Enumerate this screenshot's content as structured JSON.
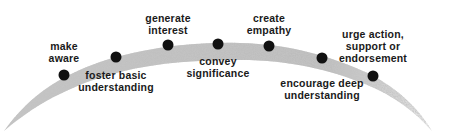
{
  "diagram": {
    "title": "",
    "arc_color": "#b8b8b8",
    "dot_color": "#111111",
    "stages": [
      {
        "label_lines": [
          "make",
          "aware"
        ],
        "dot": [
          64,
          75
        ],
        "label_pos": [
          64,
          40
        ]
      },
      {
        "label_lines": [
          "foster basic",
          "understanding"
        ],
        "dot": [
          116,
          57
        ],
        "label_pos": [
          116,
          69
        ]
      },
      {
        "label_lines": [
          "generate",
          "interest"
        ],
        "dot": [
          168,
          45
        ],
        "label_pos": [
          168,
          12
        ]
      },
      {
        "label_lines": [
          "convey",
          "significance"
        ],
        "dot": [
          218,
          44
        ],
        "label_pos": [
          218,
          55
        ]
      },
      {
        "label_lines": [
          "create",
          "empathy"
        ],
        "dot": [
          269,
          46
        ],
        "label_pos": [
          269,
          12
        ]
      },
      {
        "label_lines": [
          "encourage deep",
          "understanding"
        ],
        "dot": [
          322,
          58
        ],
        "label_pos": [
          322,
          77
        ]
      },
      {
        "label_lines": [
          "urge action,",
          "support or",
          "endorsement"
        ],
        "dot": [
          373,
          76
        ],
        "label_pos": [
          373,
          28
        ]
      }
    ]
  }
}
